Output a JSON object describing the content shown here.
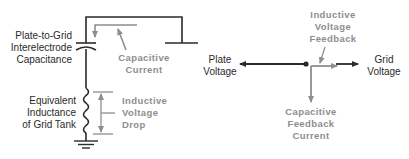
{
  "circuit": {
    "capacitance_label": [
      "Plate-to-Grid",
      "Interelectrode",
      "Capacitance"
    ],
    "current_label": [
      "Capacitive",
      "Current"
    ],
    "inductance_label": [
      "Equivalent",
      "Inductance",
      "of Grid Tank"
    ],
    "voltage_drop_label": [
      "Inductive",
      "Voltage",
      "Drop"
    ]
  },
  "phasor": {
    "plate_voltage_label": [
      "Plate",
      "Voltage"
    ],
    "grid_voltage_label": [
      "Grid",
      "Voltage"
    ],
    "inductive_feedback_label": [
      "Inductive",
      "Voltage",
      "Feedback"
    ],
    "capacitive_feedback_label": [
      "Capacitive",
      "Feedback",
      "Current"
    ]
  },
  "colors": {
    "ink": "#2a2a2a",
    "grey": "#8e8e8e"
  }
}
